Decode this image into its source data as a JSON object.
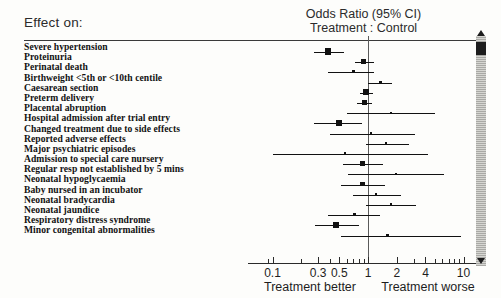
{
  "header": {
    "effect_on": "Effect on:",
    "or_line1": "Odds Ratio (95%  CI)",
    "or_line2": "Treatment : Control"
  },
  "axis": {
    "better_label": "Treatment better",
    "worse_label": "Treatment worse",
    "ticks": [
      "0.1",
      "0.3",
      "0.5",
      "1",
      "2",
      "4",
      "10"
    ]
  },
  "colors": {
    "ink": "#121212",
    "rule": "#3a3a3a",
    "null_line": "#5a5a5a",
    "marker": "#111111"
  },
  "chart_data": {
    "type": "scatter",
    "subtype": "forest-plot",
    "title": "Odds Ratio (95%  CI) Treatment : Control",
    "xlabel": "Odds Ratio",
    "ylabel": "Effect on:",
    "xscale": "log",
    "xlim": [
      0.085,
      12
    ],
    "xticks": [
      0.1,
      0.3,
      0.5,
      1,
      2,
      4,
      10
    ],
    "xticklabels": [
      "0.1",
      "0.3",
      "0.5",
      "1",
      "2",
      "4",
      "10"
    ],
    "null_value": 1,
    "grid": false,
    "legend": null,
    "annotations": [
      "Treatment better",
      "Treatment worse"
    ],
    "categories": [
      "Severe hypertension",
      "Proteinuria",
      "Perinatal death",
      "Birthweight <5th or <10th centile",
      "Caesarean section",
      "Preterm delivery",
      "Placental abruption",
      "Hospital admission after trial entry",
      "Changed treatment due to side effects",
      "Reported adverse effects",
      "Major psychiatric episodes",
      "Admission to special care nursery",
      "Regular resp not established by 5 mins",
      "Neonatal hypoglycaemia",
      "Baby nursed in an incubator",
      "Neonatal bradycardia",
      "Neonatal jaundice",
      "Respiratory distress syndrome",
      "Minor congenital abnormalities"
    ],
    "series": [
      {
        "name": "Odds Ratio (95% CI)",
        "points": [
          {
            "label": "Severe hypertension",
            "or": 0.38,
            "low": 0.27,
            "high": 0.56,
            "size": "large"
          },
          {
            "label": "Proteinuria",
            "or": 0.9,
            "low": 0.73,
            "high": 1.15,
            "size": "medium"
          },
          {
            "label": "Perinatal death",
            "or": 0.7,
            "low": 0.38,
            "high": 1.15,
            "size": "small"
          },
          {
            "label": "Birthweight <5th or <10th centile",
            "or": 1.35,
            "low": 1.0,
            "high": 1.8,
            "size": "small"
          },
          {
            "label": "Caesarean section",
            "or": 0.96,
            "low": 0.83,
            "high": 1.12,
            "size": "large"
          },
          {
            "label": "Preterm delivery",
            "or": 0.92,
            "low": 0.76,
            "high": 1.1,
            "size": "medium"
          },
          {
            "label": "Placental abruption",
            "or": 1.75,
            "low": 0.6,
            "high": 5.0,
            "size": "tiny"
          },
          {
            "label": "Hospital admission after trial entry",
            "or": 0.5,
            "low": 0.27,
            "high": 0.86,
            "size": "large"
          },
          {
            "label": "Changed treatment due to side effects",
            "or": 1.08,
            "low": 0.4,
            "high": 3.1,
            "size": "tiny"
          },
          {
            "label": "Reported adverse effects",
            "or": 1.55,
            "low": 0.95,
            "high": 2.7,
            "size": "tiny"
          },
          {
            "label": "Major psychiatric episodes",
            "or": 0.57,
            "low": 0.1,
            "high": 4.2,
            "size": "tiny"
          },
          {
            "label": "Admission to special care nursery",
            "or": 0.88,
            "low": 0.55,
            "high": 1.45,
            "size": "medium"
          },
          {
            "label": "Regular resp not established by 5 mins",
            "or": 1.95,
            "low": 0.62,
            "high": 6.2,
            "size": "tiny"
          },
          {
            "label": "Neonatal hypoglycaemia",
            "or": 0.88,
            "low": 0.52,
            "high": 1.5,
            "size": "medium"
          },
          {
            "label": "Baby nursed in an incubator",
            "or": 1.22,
            "low": 0.7,
            "high": 2.2,
            "size": "tiny"
          },
          {
            "label": "Neonatal bradycardia",
            "or": 1.75,
            "low": 0.95,
            "high": 3.2,
            "size": "tiny"
          },
          {
            "label": "Neonatal jaundice",
            "or": 0.72,
            "low": 0.38,
            "high": 1.35,
            "size": "small"
          },
          {
            "label": "Respiratory distress syndrome",
            "or": 0.46,
            "low": 0.28,
            "high": 0.8,
            "size": "large"
          },
          {
            "label": "Minor congenital abnormalities",
            "or": 1.6,
            "low": 0.52,
            "high": 9.5,
            "size": "tiny"
          }
        ]
      }
    ]
  }
}
